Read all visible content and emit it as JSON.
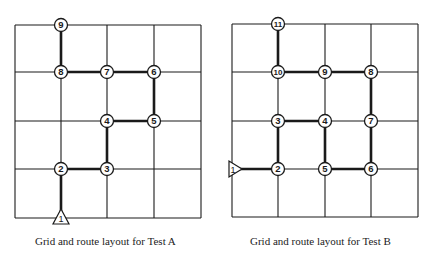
{
  "diagrams": [
    {
      "id": "A",
      "caption": "Grid and route layout for Test A",
      "grid": {
        "x": [
          15,
          61,
          107,
          154,
          201
        ],
        "y": [
          25,
          72,
          121,
          169,
          218
        ]
      },
      "start": {
        "label": "1",
        "col": 1,
        "row": 4,
        "pointer": "up"
      },
      "nodes": [
        {
          "label": "2",
          "col": 1,
          "row": 3
        },
        {
          "label": "3",
          "col": 2,
          "row": 3
        },
        {
          "label": "4",
          "col": 2,
          "row": 2
        },
        {
          "label": "5",
          "col": 3,
          "row": 2
        },
        {
          "label": "6",
          "col": 3,
          "row": 1
        },
        {
          "label": "7",
          "col": 2,
          "row": 1
        },
        {
          "label": "8",
          "col": 1,
          "row": 1
        },
        {
          "label": "9",
          "col": 1,
          "row": 0
        }
      ],
      "route": [
        "1",
        "2",
        "3",
        "4",
        "5",
        "6",
        "7",
        "8",
        "9"
      ]
    },
    {
      "id": "B",
      "caption": "Grid and route layout for Test B",
      "grid": {
        "x": [
          232,
          278,
          325,
          371,
          418
        ],
        "y": [
          24,
          72,
          121,
          169,
          217
        ]
      },
      "start": {
        "label": "1",
        "col": 0,
        "row": 3,
        "pointer": "right"
      },
      "nodes": [
        {
          "label": "2",
          "col": 1,
          "row": 3
        },
        {
          "label": "3",
          "col": 1,
          "row": 2
        },
        {
          "label": "4",
          "col": 2,
          "row": 2
        },
        {
          "label": "5",
          "col": 2,
          "row": 3
        },
        {
          "label": "6",
          "col": 3,
          "row": 3
        },
        {
          "label": "7",
          "col": 3,
          "row": 2
        },
        {
          "label": "8",
          "col": 3,
          "row": 1
        },
        {
          "label": "9",
          "col": 2,
          "row": 1
        },
        {
          "label": "10",
          "col": 1,
          "row": 1
        },
        {
          "label": "11",
          "col": 1,
          "row": 0
        }
      ],
      "route": [
        "1",
        "2",
        "3",
        "4",
        "5",
        "6",
        "7",
        "8",
        "9",
        "10",
        "11"
      ]
    }
  ],
  "colors": {
    "line": "#1a1a1a",
    "background": "#ffffff"
  }
}
